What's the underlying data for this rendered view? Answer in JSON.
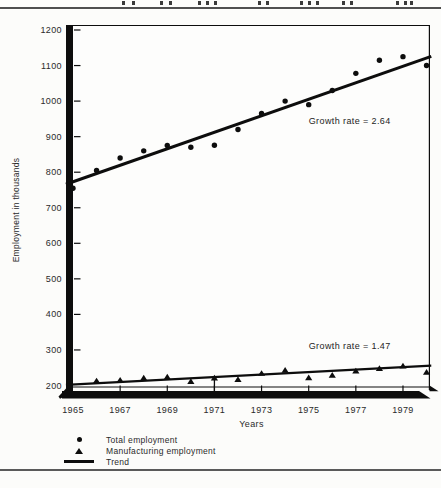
{
  "chart_data": {
    "type": "scatter",
    "title": "",
    "xlabel": "Years",
    "ylabel": "Employment in thousands",
    "xlim": [
      1964.7,
      1980.2
    ],
    "ylim": [
      200,
      1200
    ],
    "x_ticks": [
      1965,
      1967,
      1969,
      1971,
      1973,
      1975,
      1977,
      1979
    ],
    "y_ticks": [
      200,
      300,
      400,
      500,
      600,
      700,
      800,
      900,
      1000,
      1100,
      1200
    ],
    "grid": "off",
    "series": [
      {
        "name": "Total employment",
        "marker": "circle",
        "x": [
          1965,
          1966,
          1967,
          1968,
          1969,
          1970,
          1971,
          1972,
          1973,
          1974,
          1975,
          1976,
          1977,
          1978,
          1979,
          1980
        ],
        "y": [
          755,
          805,
          840,
          860,
          875,
          870,
          876,
          920,
          965,
          1000,
          990,
          1030,
          1078,
          1115,
          1125,
          1100
        ]
      },
      {
        "name": "Manufacturing employment",
        "marker": "triangle",
        "x": [
          1966,
          1967,
          1968,
          1969,
          1970,
          1971,
          1972,
          1973,
          1974,
          1975,
          1976,
          1977,
          1978,
          1979,
          1980
        ],
        "y": [
          212,
          214,
          220,
          223,
          210,
          220,
          216,
          233,
          242,
          221,
          228,
          240,
          247,
          254,
          236
        ]
      },
      {
        "name": "Trend",
        "marker": "line",
        "trend_for": "Total employment",
        "x": [
          1964.7,
          1980.2
        ],
        "y": [
          766,
          1126
        ]
      },
      {
        "name": "Trend",
        "marker": "line",
        "trend_for": "Manufacturing employment",
        "x": [
          1964.7,
          1980.2
        ],
        "y": [
          202,
          256
        ]
      }
    ],
    "annotations": [
      {
        "text": "Growth rate = 2.64",
        "year": 1975.0,
        "value": 945,
        "series": "Total employment"
      },
      {
        "text": "Growth rate = 1.47",
        "year": 1975.0,
        "value": 312,
        "series": "Manufacturing employment"
      }
    ],
    "axis_arrow_year": 1971,
    "legend_position": "bottom-left"
  },
  "legend": {
    "items": [
      {
        "marker": "circle",
        "label": "Total employment"
      },
      {
        "marker": "triangle",
        "label": "Manufacturing employment"
      },
      {
        "marker": "line",
        "label": "Trend"
      }
    ]
  }
}
